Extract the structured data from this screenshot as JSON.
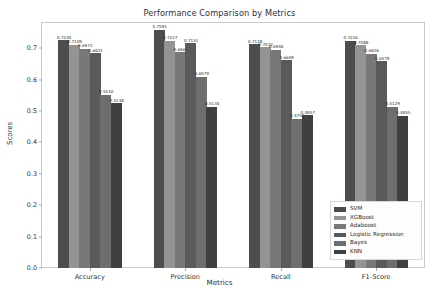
{
  "chart_data": {
    "type": "bar",
    "title": "Performance Comparison by Metrics",
    "xlabel": "Metrics",
    "ylabel": "Scores",
    "categories": [
      "Accuracy",
      "Precision",
      "Recall",
      "F1-Score"
    ],
    "ylim": [
      0.0,
      0.78
    ],
    "yticks": [
      "0.0",
      "0.1",
      "0.2",
      "0.3",
      "0.4",
      "0.5",
      "0.6",
      "0.7"
    ],
    "ytick_values": [
      0.0,
      0.1,
      0.2,
      0.3,
      0.4,
      0.5,
      0.6,
      0.7
    ],
    "grid": false,
    "legend_position": "lower right",
    "series": [
      {
        "name": "SVM",
        "color": "#4d4d4d",
        "values": [
          0.7245,
          0.7591,
          0.7128,
          0.7226
        ],
        "labels": [
          "0.7245",
          "0.7591",
          "0.7128",
          "0.7226"
        ]
      },
      {
        "name": "XGBoost",
        "color": "#949494",
        "values": [
          0.7109,
          0.7227,
          0.7032,
          0.7088
        ],
        "labels": [
          "0.7109",
          "0.7227",
          "0.7032",
          "0.7088"
        ]
      },
      {
        "name": "Adaboost",
        "color": "#787878",
        "values": [
          0.6973,
          0.6868,
          0.6948,
          0.6828
        ],
        "labels": [
          "0.6973",
          "0.6868",
          "0.6948",
          "0.6828"
        ]
      },
      {
        "name": "Logistic Regression",
        "color": "#5a5a5a",
        "values": [
          0.6831,
          0.7151,
          0.6609,
          0.6579
        ],
        "labels": [
          "0.6831",
          "0.7151",
          "0.6609",
          "0.6579"
        ]
      },
      {
        "name": "Bayes",
        "color": "#6e6e6e",
        "values": [
          0.551,
          0.6079,
          0.4758,
          0.5129
        ],
        "labels": [
          "0.5510",
          "0.6079",
          "0.4758",
          "0.5129"
        ]
      },
      {
        "name": "KNN",
        "color": "#404040",
        "values": [
          0.5238,
          0.5134,
          0.4857,
          0.4855
        ],
        "labels": [
          "0.5238",
          "0.5134",
          "0.4857",
          "0.4855"
        ]
      }
    ]
  }
}
